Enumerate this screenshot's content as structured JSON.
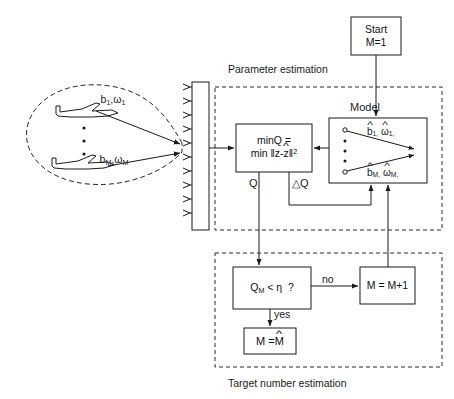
{
  "figure": {
    "type": "block-diagram",
    "line_color": "#1a1a1a",
    "dashed_color": "#2a2a2a",
    "background": "#ffffff"
  },
  "scene": {
    "target_group_label": "targets-cluster",
    "aircraft": [
      {
        "id": "aircraft-top",
        "label_b": "b",
        "label_b_sub": "1",
        "label_omega": "ω",
        "label_omega_sub": "1"
      },
      {
        "id": "aircraft-bottom",
        "label_b": "b",
        "label_b_sub": "M",
        "label_omega": "ω",
        "label_omega_sub": "M"
      }
    ],
    "label_top": "b₁,ω₁",
    "label_bottom": "bₘ,ωₘ",
    "vertical_dots": "·",
    "antenna_element_count": 10
  },
  "sections": {
    "parameter_estimation": {
      "label": "Parameter estimation"
    },
    "target_number_estimation": {
      "label": "Target number estimation"
    }
  },
  "blocks": {
    "start": {
      "line1": "Start",
      "line2": "M=1"
    },
    "min_q": {
      "line1": "minQ =",
      "line2_prefix": "min ‖z-",
      "line2_hat": "z",
      "line2_suffix": "‖",
      "line2_exp": "2"
    },
    "model": {
      "title": "Model",
      "top_b": "b",
      "top_b_sub": "1,",
      "top_w": "ω",
      "top_w_sub": "1,",
      "bot_b": "b",
      "bot_b_sub": "M,",
      "bot_w": "ω",
      "bot_w_sub": "M,",
      "hat": "^"
    },
    "decision": {
      "q": "Q",
      "q_sub": "M",
      "op": "<",
      "eta": "η",
      "question": "?"
    },
    "increment": {
      "text": "M = M+1"
    },
    "result": {
      "prefix": "M =",
      "var": "M",
      "hat": "^"
    }
  },
  "edge_labels": {
    "q": "Q",
    "delta_q": "△Q",
    "no": "no",
    "yes": "yes"
  }
}
